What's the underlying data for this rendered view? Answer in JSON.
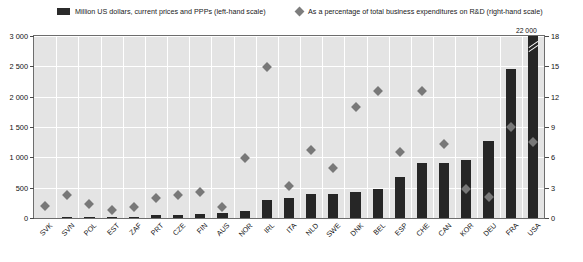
{
  "legend": {
    "bar_label": "Million US dollars, current prices and PPPs (left-hand scale)",
    "point_label": "As a percentage of total business expenditures on R&D (right-hand scale)",
    "bar_swatch_icon": "filled-square-icon",
    "point_swatch_icon": "diamond-icon"
  },
  "annotation": {
    "truncated_value_label": "22 000"
  },
  "chart_data": {
    "type": "bar",
    "title": "",
    "subtitle": "",
    "xlabel": "",
    "ylabel": "Million US dollars, current prices and PPPs",
    "y2label": "As a percentage of total business expenditures on R&D",
    "grid": true,
    "legend_position": "top",
    "ylim": [
      0,
      3000
    ],
    "y2lim": [
      0,
      18
    ],
    "yticks": [
      "0",
      "500",
      "1 000",
      "1 500",
      "2 000",
      "2 500",
      "3 000"
    ],
    "ytick_values": [
      0,
      500,
      1000,
      1500,
      2000,
      2500,
      3000
    ],
    "y2ticks": [
      "0",
      "3",
      "6",
      "9",
      "12",
      "15",
      "18"
    ],
    "y2tick_values": [
      0,
      3,
      6,
      9,
      12,
      15,
      18
    ],
    "categories": [
      "SVK",
      "SVN",
      "POL",
      "EST",
      "ZAF",
      "PRT",
      "CZE",
      "FIN",
      "AUS",
      "NOR",
      "IRL",
      "ITA",
      "NLD",
      "SWE",
      "DNK",
      "BEL",
      "ESP",
      "CHE",
      "CAN",
      "KOR",
      "DEU",
      "FRA",
      "USA"
    ],
    "series": [
      {
        "name": "Million US dollars, current prices and PPPs (left-hand scale)",
        "type": "bar",
        "axis": "left",
        "color": "#262626",
        "values": [
          8,
          10,
          15,
          18,
          22,
          45,
          55,
          60,
          90,
          115,
          300,
          330,
          390,
          400,
          430,
          480,
          680,
          900,
          905,
          960,
          1275,
          2455,
          22000
        ],
        "truncated": [
          false,
          false,
          false,
          false,
          false,
          false,
          false,
          false,
          false,
          false,
          false,
          false,
          false,
          false,
          false,
          false,
          false,
          false,
          false,
          false,
          false,
          false,
          true
        ]
      },
      {
        "name": "As a percentage of total business expenditures on R&D (right-hand scale)",
        "type": "scatter",
        "axis": "right",
        "color": "#787878",
        "marker": "diamond",
        "values": [
          1.2,
          2.3,
          1.4,
          0.8,
          1.1,
          2.0,
          2.3,
          2.6,
          1.1,
          5.9,
          14.9,
          3.2,
          6.7,
          4.9,
          11.0,
          12.6,
          6.5,
          12.6,
          7.3,
          2.9,
          2.1,
          9.0,
          7.5
        ]
      }
    ]
  }
}
